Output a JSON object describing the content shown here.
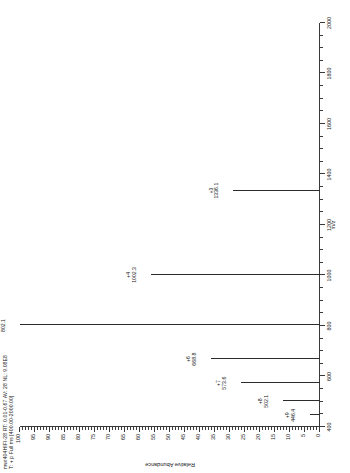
{
  "header": {
    "line1": "mwt404HIFI-28  RT: 0.01-0.67  AV: 28  NL: 9.08E8",
    "line2": "T: + p Full ms [400.00-2000.00]"
  },
  "chart_data": {
    "type": "bar",
    "title": "mwt404HIFI-28  RT: 0.01-0.67  AV: 28  NL: 9.08E8",
    "subtitle": "T: + p Full ms [400.00-2000.00]",
    "xlabel": "m/z",
    "ylabel": "Relative Abundance",
    "xlim": [
      400,
      2000
    ],
    "ylim": [
      0,
      100
    ],
    "grid": false,
    "legend": "none",
    "orientation": "rotated-90",
    "xticks": [
      400,
      600,
      800,
      1000,
      1200,
      1400,
      1600,
      1800,
      2000
    ],
    "yticks": [
      0,
      5,
      10,
      15,
      20,
      25,
      30,
      35,
      40,
      45,
      50,
      55,
      60,
      65,
      70,
      75,
      80,
      85,
      90,
      95,
      100
    ],
    "x": [
      446.4,
      502.1,
      573.6,
      668.8,
      802.1,
      1002.3,
      1336.1
    ],
    "values": [
      3.5,
      12.5,
      26.5,
      36.5,
      100.0,
      56.5,
      29.0
    ],
    "point_labels": [
      "+9",
      "+8",
      "+7",
      "+6",
      "+5",
      "+4",
      "+3"
    ],
    "annotations": [
      {
        "charge": "+9",
        "mz": "446.4",
        "x": 446.4,
        "y": 3.5
      },
      {
        "charge": "+8",
        "mz": "502.1",
        "x": 502.1,
        "y": 12.5
      },
      {
        "charge": "+7",
        "mz": "573.6",
        "x": 573.6,
        "y": 26.5
      },
      {
        "charge": "+6",
        "mz": "668.8",
        "x": 668.8,
        "y": 36.5
      },
      {
        "charge": "+5",
        "mz": "802.1",
        "x": 802.1,
        "y": 100.0
      },
      {
        "charge": "+4",
        "mz": "1002.3",
        "x": 1002.3,
        "y": 56.5
      },
      {
        "charge": "+3",
        "mz": "1336.1",
        "x": 1336.1,
        "y": 29.0
      }
    ]
  },
  "axes": {
    "y_title": "Relative Abundance",
    "x_title": "m/z",
    "y_tick_labels": [
      "100",
      "95",
      "90",
      "85",
      "80",
      "75",
      "70",
      "65",
      "60",
      "55",
      "50",
      "45",
      "40",
      "35",
      "30",
      "25",
      "20",
      "15",
      "10",
      "5",
      "0"
    ],
    "x_tick_labels": [
      "400",
      "600",
      "800",
      "1000",
      "1200",
      "1400",
      "1600",
      "1800",
      "2000"
    ]
  },
  "colors": {
    "trace": "#2b2b2b",
    "axis": "#3a3a3a",
    "background": "#ffffff",
    "text": "#1a1a1a"
  }
}
